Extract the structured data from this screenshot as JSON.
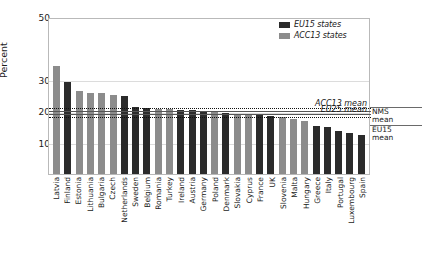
{
  "chart_data": {
    "type": "bar",
    "title": "",
    "xlabel": "",
    "ylabel": "Percent",
    "ylim": [
      0,
      50
    ],
    "yticks": [
      10,
      20,
      30,
      50
    ],
    "grid": "horizontal",
    "legend_position": "top-right",
    "categories": [
      "Latvia",
      "Finland",
      "Estonia",
      "Lithuania",
      "Bulgaria",
      "Czech",
      "Netherlands",
      "Sweden",
      "Belgium",
      "Romania",
      "Turkey",
      "Ireland",
      "Austria",
      "Germany",
      "Poland",
      "Denmark",
      "Slovakia",
      "Cyprus",
      "France",
      "UK",
      "Slovenia",
      "Malta",
      "Hungary",
      "Greece",
      "Italy",
      "Portugal",
      "Luxembourg",
      "Spain"
    ],
    "values": [
      35.0,
      29.6,
      26.8,
      26.3,
      26.1,
      25.4,
      25.1,
      21.6,
      21.4,
      21.0,
      20.9,
      20.8,
      20.6,
      20.4,
      20.2,
      19.8,
      19.4,
      19.2,
      18.9,
      18.6,
      18.3,
      17.9,
      17.2,
      15.5,
      15.1,
      14.0,
      13.4,
      12.6
    ],
    "groups": [
      "acc13",
      "eu15",
      "acc13",
      "acc13",
      "acc13",
      "acc13",
      "eu15",
      "eu15",
      "eu15",
      "acc13",
      "acc13",
      "eu15",
      "eu15",
      "eu15",
      "acc13",
      "eu15",
      "acc13",
      "acc13",
      "eu15",
      "eu15",
      "acc13",
      "acc13",
      "acc13",
      "eu15",
      "eu15",
      "eu15",
      "eu15",
      "eu15"
    ],
    "series": [
      {
        "name": "EU15 states",
        "key": "eu15",
        "color": "#2b2b2b"
      },
      {
        "name": "ACC13 states",
        "key": "acc13",
        "color": "#8c8c8c"
      }
    ],
    "reference_lines": [
      {
        "name": "ACC13 mean",
        "value": 21.2,
        "style": "dotted",
        "label": "ACC13 mean"
      },
      {
        "name": "NMS mean",
        "value": 20.4,
        "style": "solid",
        "label": "NMS mean"
      },
      {
        "name": "EU25 mean",
        "value": 19.4,
        "style": "solid",
        "label": "EU25 mean"
      },
      {
        "name": "EU15 mean",
        "value": 18.4,
        "style": "dotted",
        "label": "EU15 mean"
      }
    ]
  },
  "legend": {
    "items": [
      {
        "label": "EU15 states",
        "key": "eu15"
      },
      {
        "label": "ACC13 states",
        "key": "acc13"
      }
    ]
  },
  "right_band": {
    "nms": {
      "line1": "NMS",
      "line2": "mean"
    },
    "eu15": {
      "line1": "EU15",
      "line2": "mean"
    }
  },
  "axis": {
    "y_title": "Percent",
    "y_ticks": [
      "50",
      "30",
      "20",
      "10"
    ]
  },
  "colors": {
    "eu15": "#2b2b2b",
    "acc13": "#8c8c8c",
    "grid": "#dcdcdc",
    "frame": "#b9b9b9"
  }
}
